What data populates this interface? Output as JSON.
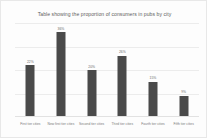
{
  "chart_data": {
    "type": "bar",
    "title": "Table showing the proportion of consumers in pubs by city",
    "xlabel": "",
    "ylabel": "",
    "ylim": [
      0,
      40
    ],
    "grid": true,
    "legend": "none",
    "gridline_values": [
      10,
      20,
      30,
      40
    ],
    "categories": [
      "First tier cities",
      "New first tier cities",
      "Second tier cities",
      "Third tier cities",
      "Fourth tier cities",
      "Fifth tier cities"
    ],
    "values": [
      22,
      36,
      20,
      26,
      15,
      9
    ],
    "value_labels": [
      "22%",
      "36%",
      "20%",
      "26%",
      "15%",
      "9%"
    ],
    "series": [
      {
        "name": "Proportion of consumers",
        "values": [
          22,
          36,
          20,
          26,
          15,
          9
        ]
      }
    ],
    "colors": {
      "bar": "#4a4a4a",
      "grid": "#ececec",
      "axis": "#e2e2e2",
      "title_text": "#5d5d5d",
      "tick_text": "#787878",
      "value_text": "#6a6a6a",
      "background": "#fdfdfd",
      "border": "#e8e8e8"
    }
  }
}
